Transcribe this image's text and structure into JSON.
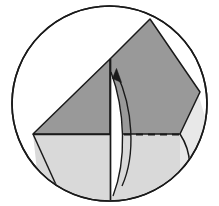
{
  "figure": {
    "caption": "",
    "width": 219,
    "height": 206,
    "background_color": "#ffffff"
  },
  "colors": {
    "stroke": "#1a1a1a",
    "dark_fill": "#999999",
    "light_fill": "#d9d9d9",
    "pale_fill": "#e8e8e8",
    "white_fill": "#ffffff",
    "background": "#ffffff"
  },
  "geometry": {
    "circle": {
      "name": "outer-circle",
      "cx": 109.5,
      "cy": 103.5,
      "r": 97.5,
      "fill": "#ffffff",
      "stroke_width": 1.6
    },
    "dark_triangle_left": {
      "name": "left-dark-flap",
      "points": "33,135 110,60 110,135",
      "fill": "#999999"
    },
    "dark_quad_right": {
      "name": "right-dark-flap",
      "points": "110,60 150,20 196,88 180,135 110,135",
      "fill": "#999999"
    },
    "light_region_lower": {
      "name": "lower-light-flap",
      "points": "33,135 180,135 180,180 150,197 60,195 33,170",
      "fill": "#d9d9d9"
    },
    "pale_sliver_right": {
      "name": "right-pale-sliver",
      "points": "180,135 196,140 197,160 186,180 178,186",
      "fill": "#e8e8e8"
    },
    "vertical_fold_line": {
      "name": "vertical-fold-line",
      "x1": 110,
      "y1": 60,
      "x2": 110,
      "y2": 198,
      "stroke_width": 1.6
    },
    "horizontal_solid_line": {
      "name": "horizontal-solid-edge",
      "x1": 33,
      "y1": 135,
      "x2": 112,
      "y2": 135,
      "stroke_width": 1.6
    },
    "horizontal_dashed_line": {
      "name": "horizontal-dashed-edge",
      "x1": 112,
      "y1": 135,
      "x2": 180,
      "y2": 135,
      "stroke_width": 1.8,
      "dash_pattern": "7 5"
    },
    "rotation_arc": {
      "name": "rotation-arrow-arc",
      "path": "M 118 190 C 134 160 132 110 116 73",
      "stroke_width": 1.5,
      "direction": "upward"
    },
    "rotation_arrow_head": {
      "name": "rotation-arrow-head",
      "points": "116,70 121,82 112,79",
      "fill": "#1a1a1a"
    },
    "thin_sliver_inner": {
      "name": "inner-thin-sliver",
      "path": "M 114 190 C 126 158 124 112 112 76 L 112 190 Z",
      "fill": "#ffffff"
    }
  },
  "labels": {
    "vertices": [],
    "annotations": []
  }
}
